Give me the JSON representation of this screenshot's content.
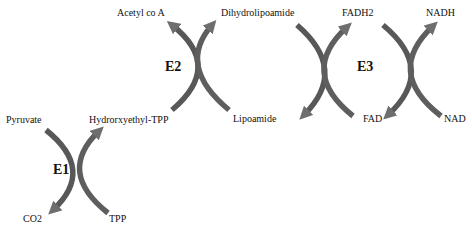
{
  "diagram": {
    "type": "pyruvate-dehydrogenase-complex-reaction-scheme",
    "colors": {
      "arrow_dark": "#4e4e4e",
      "arrow_light": "#7a7a7a",
      "text": "#111111",
      "background": "#ffffff"
    },
    "enzymes": [
      {
        "label": "E1",
        "inputs": [
          "Pyruvate",
          "TPP"
        ],
        "outputs": [
          "CO2",
          "Hydrorxyethyl-TPP"
        ]
      },
      {
        "label": "E2",
        "inputs": [
          "Hydrorxyethyl-TPP",
          "Lipoamide"
        ],
        "outputs": [
          "Acetyl co A",
          "Dihydrolipoamide"
        ]
      },
      {
        "label": "E3",
        "inputs": [
          "Dihydrolipoamide",
          "FAD",
          "NAD"
        ],
        "outputs": [
          "Lipoamide",
          "FADH2",
          "NADH"
        ]
      }
    ],
    "labels": {
      "pyruvate": "Pyruvate",
      "hydroxyethyl_tpp": "Hydrorxyethyl-TPP",
      "co2": "CO2",
      "tpp": "TPP",
      "acetyl_coa": "Acetyl co A",
      "dihydrolipoamide": "Dihydrolipoamide",
      "lipoamide": "Lipoamide",
      "fadh2": "FADH2",
      "fad": "FAD",
      "nadh": "NADH",
      "nad": "NAD"
    }
  }
}
